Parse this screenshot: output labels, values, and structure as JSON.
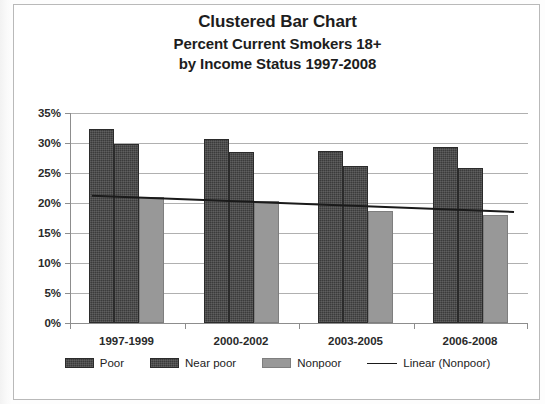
{
  "chart_data": {
    "type": "bar",
    "title": "Clustered Bar Chart",
    "subtitle_line1": "Percent Current Smokers 18+",
    "subtitle_line2": "by Income Status 1997-2008",
    "xlabel": "",
    "ylabel": "",
    "ylim": [
      0,
      35
    ],
    "ytick_labels": [
      "0%",
      "5%",
      "10%",
      "15%",
      "20%",
      "25%",
      "30%",
      "35%"
    ],
    "ytick_values": [
      0,
      5,
      10,
      15,
      20,
      25,
      30,
      35
    ],
    "grid": true,
    "legend_position": "bottom",
    "categories": [
      "1997-1999",
      "2000-2002",
      "2003-2005",
      "2006-2008"
    ],
    "series": [
      {
        "name": "Poor",
        "color": "#3b3b3b",
        "values": [
          32.4,
          30.6,
          28.7,
          29.3
        ]
      },
      {
        "name": "Near poor",
        "color": "#3b3b3b",
        "values": [
          29.8,
          28.5,
          26.2,
          25.8
        ]
      },
      {
        "name": "Nonpoor",
        "color": "#989898",
        "values": [
          21.0,
          20.3,
          18.7,
          18.0
        ]
      }
    ],
    "trendline": {
      "name": "Linear (Nonpoor)",
      "color": "#1a1a1a",
      "start_value": 21.2,
      "end_value": 18.5
    }
  },
  "legend": {
    "items": [
      {
        "label": "Poor",
        "swatch": "poor"
      },
      {
        "label": "Near poor",
        "swatch": "nearpoor"
      },
      {
        "label": "Nonpoor",
        "swatch": "nonpoor"
      },
      {
        "label": "Linear (Nonpoor)",
        "swatch": "line"
      }
    ]
  }
}
